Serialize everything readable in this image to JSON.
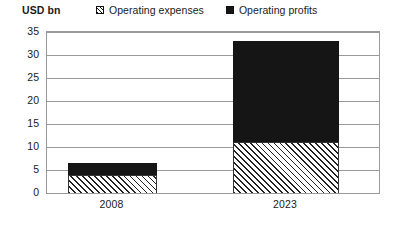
{
  "chart_data": {
    "type": "bar",
    "subtype": "stacked-bar",
    "title": "",
    "unit_label": "USD bn",
    "xlabel": "",
    "ylabel": "USD bn",
    "categories": [
      "2008",
      "2023"
    ],
    "series": [
      {
        "name": "Operating expenses",
        "values": [
          4,
          11
        ],
        "pattern": "diagonal-hatch",
        "color": "#ffffff"
      },
      {
        "name": "Operating profits",
        "values": [
          2.5,
          22
        ],
        "pattern": "solid",
        "color": "#151515"
      }
    ],
    "totals": [
      6.5,
      33
    ],
    "ylim": [
      0,
      35
    ],
    "ytick_values": [
      0,
      5,
      10,
      15,
      20,
      25,
      30,
      35
    ],
    "ytick_labels": [
      "0",
      "5",
      "10",
      "15",
      "20",
      "25",
      "30",
      "35"
    ],
    "grid": true,
    "legend_position": "top"
  },
  "legend": {
    "items": [
      {
        "label": "Operating expenses",
        "swatch": "hatched-square"
      },
      {
        "label": "Operating profits",
        "swatch": "filled-black-square"
      }
    ]
  },
  "axis": {
    "unit_label": "USD bn",
    "y_ticks": [
      "35",
      "30",
      "25",
      "20",
      "15",
      "10",
      "5",
      "0"
    ],
    "x_ticks": [
      "2008",
      "2023"
    ]
  },
  "colors": {
    "ink": "#151515",
    "grid": "#9a9a9a",
    "background": "#ffffff"
  }
}
